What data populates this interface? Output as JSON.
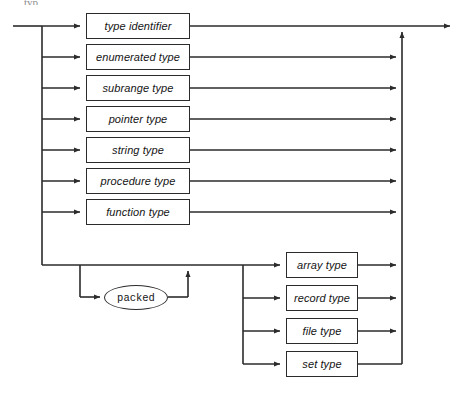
{
  "diagram": {
    "kind": "railroad-syntax-diagram",
    "title_fragment": "typ",
    "colors": {
      "background": "#ffffff",
      "line": "#2b2b2b",
      "box_border": "#2b2b2b",
      "box_fill": "#ffffff",
      "text": "#141414"
    },
    "entry": {
      "label": "entry-rail"
    },
    "exit": {
      "label": "exit-rail"
    },
    "alternatives_column_left": [
      {
        "id": "type-identifier",
        "label": "type identifier",
        "shape": "box",
        "x": 86,
        "y": 13,
        "w": 104,
        "h": 26
      },
      {
        "id": "enumerated-type",
        "label": "enumerated type",
        "shape": "box",
        "x": 86,
        "y": 44,
        "w": 104,
        "h": 26
      },
      {
        "id": "subrange-type",
        "label": "subrange type",
        "shape": "box",
        "x": 86,
        "y": 75,
        "w": 104,
        "h": 26
      },
      {
        "id": "pointer-type",
        "label": "pointer type",
        "shape": "box",
        "x": 86,
        "y": 106,
        "w": 104,
        "h": 26
      },
      {
        "id": "string-type",
        "label": "string type",
        "shape": "box",
        "x": 86,
        "y": 137,
        "w": 104,
        "h": 26
      },
      {
        "id": "procedure-type",
        "label": "procedure type",
        "shape": "box",
        "x": 86,
        "y": 168,
        "w": 104,
        "h": 26
      },
      {
        "id": "function-type",
        "label": "function type",
        "shape": "box",
        "x": 86,
        "y": 199,
        "w": 104,
        "h": 26
      }
    ],
    "optional_keyword": {
      "id": "packed",
      "label": "packed",
      "shape": "ellipse",
      "x": 104,
      "y": 285,
      "w": 64,
      "h": 25
    },
    "alternatives_column_right": [
      {
        "id": "array-type",
        "label": "array type",
        "shape": "box",
        "x": 286,
        "y": 252,
        "w": 72,
        "h": 26
      },
      {
        "id": "record-type",
        "label": "record type",
        "shape": "box",
        "x": 286,
        "y": 285,
        "w": 72,
        "h": 26
      },
      {
        "id": "file-type",
        "label": "file type",
        "shape": "box",
        "x": 286,
        "y": 318,
        "w": 72,
        "h": 26
      },
      {
        "id": "set-type",
        "label": "set type",
        "shape": "box",
        "x": 286,
        "y": 351,
        "w": 72,
        "h": 26
      }
    ],
    "rails": {
      "entry_x": 13,
      "left_branch_x": 42,
      "right_merge_x": 402,
      "exit_x": 455,
      "main_y": 26,
      "packed_branch_x": 80,
      "packed_merge_x": 188,
      "lower_rail_y": 265,
      "right_branch_x": 243
    }
  }
}
